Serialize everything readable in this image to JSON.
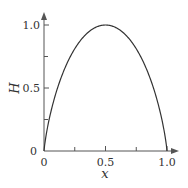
{
  "chart_data": {
    "type": "line",
    "title": "",
    "xlabel": "x",
    "ylabel": "H",
    "xlim": [
      0,
      1.0
    ],
    "ylim": [
      0,
      1.0
    ],
    "x_ticks": [
      0,
      0.25,
      0.5,
      0.75,
      1.0
    ],
    "x_tick_labels": [
      "0",
      "",
      "0.5",
      "",
      "1.0"
    ],
    "y_ticks": [
      0,
      0.25,
      0.5,
      0.75,
      1.0
    ],
    "y_tick_labels": [
      "0",
      "",
      "0.5",
      "",
      "1.0"
    ],
    "grid": false,
    "legend": null,
    "series": [
      {
        "name": "H(x)",
        "description": "binary entropy function H(x) = -x log2 x - (1-x) log2(1-x)",
        "x": [
          0,
          0.05,
          0.1,
          0.2,
          0.3,
          0.4,
          0.5,
          0.6,
          0.7,
          0.8,
          0.9,
          0.95,
          1.0
        ],
        "values": [
          0,
          0.286,
          0.469,
          0.722,
          0.881,
          0.971,
          1.0,
          0.971,
          0.881,
          0.722,
          0.469,
          0.286,
          0
        ]
      }
    ]
  },
  "labels": {
    "x_axis_title": "x",
    "y_axis_title": "H",
    "x_tick_0": "0",
    "x_tick_05": "0.5",
    "x_tick_1": "1.0",
    "y_tick_0": "0",
    "y_tick_05": "0.5",
    "y_tick_1": "1.0"
  },
  "colors": {
    "line": "#333333",
    "axis": "#555555"
  }
}
